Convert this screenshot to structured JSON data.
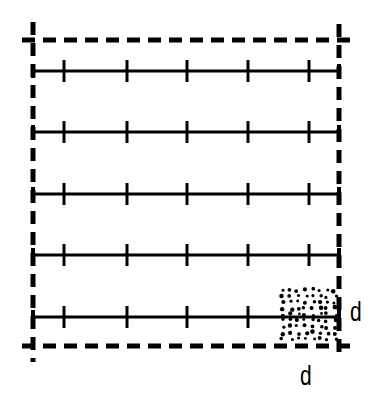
{
  "diagram": {
    "title": "",
    "colors": {
      "ink": "#000000",
      "background": "#ffffff"
    },
    "boundary": {
      "style": "dashed",
      "left_x": 33,
      "right_x": 339,
      "top_y": 40,
      "bottom_y": 346
    },
    "lines": [
      {
        "y": 71,
        "ticks": [
          64,
          127,
          187,
          248,
          309
        ]
      },
      {
        "y": 132,
        "ticks": [
          64,
          127,
          187,
          248,
          309
        ]
      },
      {
        "y": 194,
        "ticks": [
          64,
          127,
          187,
          248,
          309
        ]
      },
      {
        "y": 255,
        "ticks": [
          64,
          127,
          187,
          248,
          309
        ]
      },
      {
        "y": 317,
        "ticks": [
          64,
          127,
          187,
          248
        ]
      }
    ],
    "stipple_zone": {
      "x": 280,
      "y": 287,
      "width": 58,
      "height": 55
    },
    "labels": {
      "right_dimension": "d",
      "bottom_dimension": "d"
    }
  }
}
